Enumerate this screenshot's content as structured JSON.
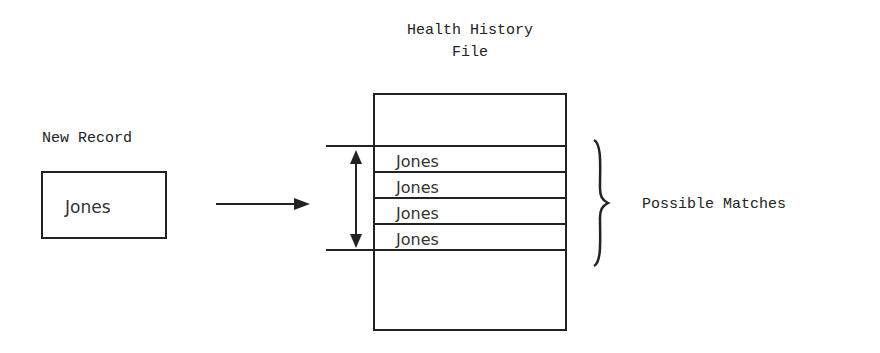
{
  "file": {
    "title_line1": "Health History",
    "title_line2": "File",
    "records": [
      "Jones",
      "Jones",
      "Jones",
      "Jones"
    ]
  },
  "new_record": {
    "label": "New Record",
    "name": "Jones"
  },
  "annotation": {
    "label": "Possible Matches"
  }
}
